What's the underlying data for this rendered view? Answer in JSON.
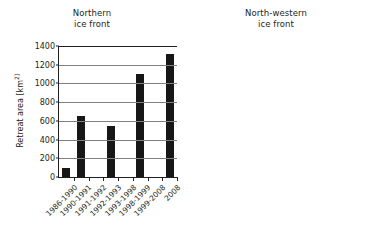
{
  "chart_data": [
    {
      "type": "bar",
      "title": "Northern ice front",
      "title_lines": [
        "Northern",
        "ice front"
      ],
      "xlabel": "",
      "ylabel": "Retreat area [km 2]",
      "ylabel_text": "Retreat area [km",
      "ylabel_sup": "2]",
      "ylim": [
        0,
        1400
      ],
      "ytick_step": 200,
      "yticks": [
        0,
        200,
        400,
        600,
        800,
        1000,
        1200,
        1400
      ],
      "grid": true,
      "legend": "none",
      "bar_color": "#171717",
      "categories": [
        "1986-1990",
        "1990-1991",
        "1991-1992",
        "1992-1993",
        "1993-1998",
        "1998-1999",
        "1999-2008",
        "2008"
      ],
      "values": [
        100,
        650,
        0,
        550,
        0,
        1100,
        0,
        1310
      ]
    },
    {
      "type": "bar",
      "title": "North-western ice front",
      "title_lines": [
        "North-western",
        "ice front"
      ],
      "xlabel": "",
      "ylabel": "",
      "ylim": [
        0,
        800
      ],
      "ytick_step": 100,
      "yticks": [
        0,
        100,
        200,
        300,
        400,
        500,
        600,
        700,
        800
      ],
      "grid": true,
      "legend": "none",
      "bar_color": "#8c8c8c",
      "categories": [
        "1990-1993",
        "1993-1998",
        "1998-1999",
        "1999-2000",
        "2000-2001",
        "2001-2003",
        "2003-2004",
        "2004-2007",
        "2008"
      ],
      "values": [
        50,
        0,
        20,
        95,
        0,
        50,
        50,
        0,
        685
      ]
    }
  ]
}
